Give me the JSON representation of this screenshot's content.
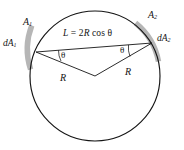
{
  "figure": {
    "type": "geometry-diagram",
    "background_color": "#ffffff",
    "stroke_color": "#141414",
    "patch_color": "#a8a8a8",
    "labels": {
      "area_1": "A",
      "area_1_sub": "1",
      "area_2": "A",
      "area_2_sub": "2",
      "d_area_1": "dA",
      "d_area_1_sub": "1",
      "d_area_2": "dA",
      "d_area_2_sub": "2",
      "radius_left": "R",
      "radius_right": "R",
      "angle_left": "θ",
      "angle_right": "θ",
      "formula_lhs": "L",
      "formula_eq": " = ",
      "formula_coeff": "2",
      "formula_radius": "R",
      "formula_fn": " cos ",
      "formula_angle": "θ",
      "formula_full": "L = 2R cos θ"
    },
    "geometry": {
      "circle_center_x": 95,
      "circle_center_y": 76,
      "circle_radius": 65,
      "chord_left_x": 36,
      "chord_left_y": 52,
      "chord_right_x": 152,
      "chord_right_y": 43,
      "chord_label": "L = 2R cos θ",
      "radius_label": "R",
      "angle_label": "θ"
    }
  }
}
